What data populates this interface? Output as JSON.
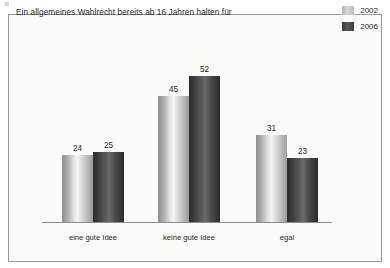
{
  "title": "Ein allgemeines Wahlrecht bereits ab\n16 Jahren halten für",
  "legend": {
    "items": [
      {
        "label": "2002",
        "color": "#cccccc",
        "swatch": "legend-swatch-2002"
      },
      {
        "label": "2006",
        "color": "#444444",
        "swatch": "legend-swatch-2006"
      }
    ]
  },
  "colors": {
    "background": "#fbfbf9",
    "frame_border": "#9a9a95",
    "baseline": "#8d8d88",
    "series_2002": "#cccccc",
    "series_2006": "#444444",
    "text": "#1d1d1d"
  },
  "chart_data": {
    "type": "bar",
    "title": "Ein allgemeines Wahlrecht bereits ab 16 Jahren halten für",
    "xlabel": "",
    "ylabel": "",
    "ylim": [
      0,
      60
    ],
    "grid": false,
    "legend_position": "top-right",
    "value_labels": true,
    "categories": [
      "eine gute Idee",
      "keine gute Idee",
      "egal"
    ],
    "series": [
      {
        "name": "2002",
        "color": "#cccccc",
        "values": [
          24,
          45,
          31
        ]
      },
      {
        "name": "2006",
        "color": "#444444",
        "values": [
          25,
          52,
          23
        ]
      }
    ]
  }
}
